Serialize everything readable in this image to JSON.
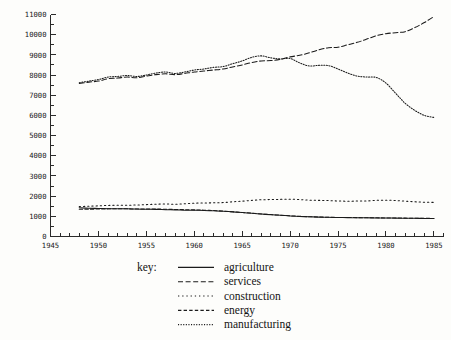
{
  "chart_data": {
    "type": "line",
    "title": "",
    "xlabel": "",
    "ylabel": "",
    "xlim": [
      1945,
      1986
    ],
    "ylim": [
      0,
      11000
    ],
    "grid": false,
    "legend_position": "bottom",
    "legend_title": "key:",
    "x_ticklabels": [
      "1945",
      "1950",
      "1955",
      "1960",
      "1965",
      "1970",
      "1975",
      "1980",
      "1985"
    ],
    "x_tickvalues": [
      1945,
      1950,
      1955,
      1960,
      1965,
      1970,
      1975,
      1980,
      1985
    ],
    "x_minor_step": 1,
    "y_ticklabels": [
      "0",
      "1000",
      "2000",
      "3000",
      "4000",
      "5000",
      "6000",
      "7000",
      "8000",
      "9000",
      "10000",
      "11000"
    ],
    "y_tickvalues": [
      0,
      1000,
      2000,
      3000,
      4000,
      5000,
      6000,
      7000,
      8000,
      9000,
      10000,
      11000
    ],
    "y_minor_step": 500,
    "x": [
      1948,
      1949,
      1950,
      1951,
      1952,
      1953,
      1954,
      1955,
      1956,
      1957,
      1958,
      1959,
      1960,
      1961,
      1962,
      1963,
      1964,
      1965,
      1966,
      1967,
      1968,
      1969,
      1970,
      1971,
      1972,
      1973,
      1974,
      1975,
      1976,
      1977,
      1978,
      1979,
      1980,
      1981,
      1982,
      1983,
      1984,
      1985
    ],
    "series": [
      {
        "name": "agriculture",
        "style": "solid",
        "color": "#1b1b1b",
        "values": [
          1420,
          1400,
          1390,
          1380,
          1375,
          1370,
          1360,
          1350,
          1345,
          1330,
          1320,
          1305,
          1300,
          1290,
          1275,
          1250,
          1220,
          1185,
          1150,
          1110,
          1080,
          1050,
          1020,
          995,
          975,
          960,
          950,
          940,
          935,
          930,
          925,
          920,
          915,
          910,
          905,
          900,
          895,
          890
        ]
      },
      {
        "name": "services",
        "style": "dashed",
        "color": "#1b1b1b",
        "values": [
          7580,
          7650,
          7700,
          7820,
          7850,
          7900,
          7870,
          7950,
          8020,
          8060,
          8020,
          8080,
          8150,
          8200,
          8250,
          8300,
          8400,
          8500,
          8620,
          8700,
          8720,
          8780,
          8900,
          8980,
          9100,
          9250,
          9350,
          9380,
          9500,
          9620,
          9780,
          9950,
          10050,
          10100,
          10150,
          10350,
          10600,
          10900
        ]
      },
      {
        "name": "construction",
        "style": "sparse-dot",
        "color": "#1b1b1b",
        "values": [
          1480,
          1500,
          1520,
          1540,
          1545,
          1550,
          1560,
          1580,
          1600,
          1610,
          1600,
          1620,
          1650,
          1660,
          1670,
          1680,
          1720,
          1750,
          1790,
          1820,
          1830,
          1840,
          1850,
          1830,
          1800,
          1790,
          1780,
          1760,
          1750,
          1755,
          1760,
          1790,
          1800,
          1780,
          1750,
          1720,
          1700,
          1690
        ]
      },
      {
        "name": "energy",
        "style": "dashed-med",
        "color": "#1b1b1b",
        "values": [
          1350,
          1355,
          1360,
          1370,
          1375,
          1370,
          1365,
          1360,
          1360,
          1350,
          1340,
          1330,
          1320,
          1305,
          1285,
          1260,
          1225,
          1190,
          1155,
          1115,
          1085,
          1055,
          1025,
          1000,
          980,
          965,
          955,
          945,
          940,
          935,
          930,
          925,
          920,
          915,
          910,
          905,
          900,
          895
        ]
      },
      {
        "name": "manufacturing",
        "style": "fine-dot",
        "color": "#1b1b1b",
        "values": [
          7620,
          7700,
          7780,
          7900,
          7930,
          7980,
          7930,
          8000,
          8100,
          8150,
          8080,
          8150,
          8250,
          8300,
          8380,
          8420,
          8560,
          8700,
          8880,
          8950,
          8850,
          8800,
          8820,
          8600,
          8450,
          8480,
          8470,
          8300,
          8100,
          7950,
          7900,
          7880,
          7600,
          7100,
          6600,
          6250,
          6000,
          5900
        ]
      }
    ]
  },
  "legend": {
    "key_label": "key:",
    "entries": [
      {
        "label": "agriculture",
        "style": "solid"
      },
      {
        "label": "services",
        "style": "dashed"
      },
      {
        "label": "construction",
        "style": "sparse-dot"
      },
      {
        "label": "energy",
        "style": "dashed-med"
      },
      {
        "label": "manufacturing",
        "style": "fine-dot"
      }
    ]
  }
}
